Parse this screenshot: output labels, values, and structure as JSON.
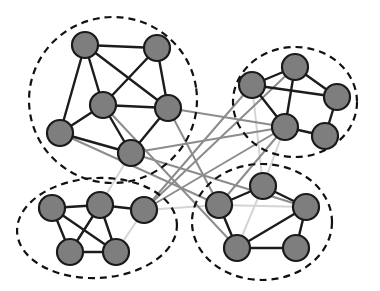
{
  "figure": {
    "width": 380,
    "height": 291,
    "background_color": "#ffffff"
  },
  "style": {
    "node_fill": "#7e7e7e",
    "node_stroke": "#1a1a1a",
    "node_radius": 13,
    "node_stroke_width": 2.2,
    "intra_edge_color": "#1c1c1c",
    "intra_edge_width": 2.4,
    "inter_edge_color": "#8c8c8c",
    "inter_edge_width": 2.0,
    "faint_edge_color": "#d5d5d5",
    "faint_edge_width": 2.0,
    "community_outline_color": "#111111",
    "community_outline_width": 2.2,
    "community_dash": "7,5"
  },
  "chart_data": {
    "type": "diagram",
    "xlabel": "",
    "ylabel": "",
    "xlim": [
      0,
      380
    ],
    "ylim": [
      0,
      291
    ],
    "grid": false,
    "legend_position": "none",
    "communities": [
      {
        "id": "c1",
        "label": "top-left-community",
        "node_count": 6,
        "cx": 113,
        "cy": 100,
        "rx": 84,
        "ry": 83,
        "rotation": -8
      },
      {
        "id": "c2",
        "label": "top-right-community",
        "node_count": 5,
        "cx": 295,
        "cy": 102,
        "rx": 62,
        "ry": 55,
        "rotation": 0
      },
      {
        "id": "c3",
        "label": "bottom-left-community",
        "node_count": 5,
        "cx": 97,
        "cy": 228,
        "rx": 80,
        "ry": 50,
        "rotation": -3
      },
      {
        "id": "c4",
        "label": "bottom-right-community",
        "node_count": 5,
        "cx": 262,
        "cy": 222,
        "rx": 70,
        "ry": 58,
        "rotation": 0
      }
    ],
    "nodes": [
      {
        "id": "n1",
        "community": "c1",
        "x": 85,
        "y": 45
      },
      {
        "id": "n2",
        "community": "c1",
        "x": 157,
        "y": 48
      },
      {
        "id": "n3",
        "community": "c1",
        "x": 103,
        "y": 105
      },
      {
        "id": "n4",
        "community": "c1",
        "x": 168,
        "y": 108
      },
      {
        "id": "n5",
        "community": "c1",
        "x": 60,
        "y": 133
      },
      {
        "id": "n6",
        "community": "c1",
        "x": 131,
        "y": 153
      },
      {
        "id": "n7",
        "community": "c2",
        "x": 295,
        "y": 67
      },
      {
        "id": "n8",
        "community": "c2",
        "x": 252,
        "y": 85
      },
      {
        "id": "n9",
        "community": "c2",
        "x": 337,
        "y": 97
      },
      {
        "id": "n10",
        "community": "c2",
        "x": 285,
        "y": 127
      },
      {
        "id": "n11",
        "community": "c2",
        "x": 325,
        "y": 136
      },
      {
        "id": "n12",
        "community": "c3",
        "x": 52,
        "y": 208
      },
      {
        "id": "n13",
        "community": "c3",
        "x": 100,
        "y": 205
      },
      {
        "id": "n14",
        "community": "c3",
        "x": 144,
        "y": 210
      },
      {
        "id": "n15",
        "community": "c3",
        "x": 70,
        "y": 252
      },
      {
        "id": "n16",
        "community": "c3",
        "x": 116,
        "y": 252
      },
      {
        "id": "n17",
        "community": "c4",
        "x": 219,
        "y": 205
      },
      {
        "id": "n18",
        "community": "c4",
        "x": 263,
        "y": 186
      },
      {
        "id": "n19",
        "community": "c4",
        "x": 306,
        "y": 207
      },
      {
        "id": "n20",
        "community": "c4",
        "x": 237,
        "y": 248
      },
      {
        "id": "n21",
        "community": "c4",
        "x": 296,
        "y": 248
      }
    ],
    "edges_intra": [
      [
        "n1",
        "n2"
      ],
      [
        "n1",
        "n3"
      ],
      [
        "n1",
        "n5"
      ],
      [
        "n1",
        "n4"
      ],
      [
        "n2",
        "n3"
      ],
      [
        "n2",
        "n4"
      ],
      [
        "n3",
        "n5"
      ],
      [
        "n3",
        "n6"
      ],
      [
        "n3",
        "n4"
      ],
      [
        "n4",
        "n6"
      ],
      [
        "n5",
        "n6"
      ],
      [
        "n7",
        "n8"
      ],
      [
        "n7",
        "n9"
      ],
      [
        "n7",
        "n10"
      ],
      [
        "n8",
        "n9"
      ],
      [
        "n8",
        "n10"
      ],
      [
        "n9",
        "n11"
      ],
      [
        "n10",
        "n11"
      ],
      [
        "n12",
        "n13"
      ],
      [
        "n12",
        "n15"
      ],
      [
        "n12",
        "n16"
      ],
      [
        "n13",
        "n14"
      ],
      [
        "n13",
        "n15"
      ],
      [
        "n13",
        "n16"
      ],
      [
        "n15",
        "n16"
      ],
      [
        "n17",
        "n18"
      ],
      [
        "n17",
        "n20"
      ],
      [
        "n18",
        "n19"
      ],
      [
        "n19",
        "n20"
      ],
      [
        "n19",
        "n21"
      ],
      [
        "n20",
        "n21"
      ]
    ],
    "edges_inter": [
      [
        "n4",
        "n10"
      ],
      [
        "n4",
        "n17"
      ],
      [
        "n6",
        "n10"
      ],
      [
        "n8",
        "n14"
      ],
      [
        "n10",
        "n17"
      ],
      [
        "n10",
        "n14"
      ],
      [
        "n14",
        "n7"
      ],
      [
        "n6",
        "n19"
      ],
      [
        "n5",
        "n17"
      ],
      [
        "n3",
        "n20"
      ]
    ],
    "edges_faint": [
      [
        "n14",
        "n17"
      ],
      [
        "n16",
        "n14"
      ],
      [
        "n13",
        "n6"
      ],
      [
        "n18",
        "n8"
      ],
      [
        "n17",
        "n19"
      ],
      [
        "n18",
        "n20"
      ],
      [
        "n10",
        "n18"
      ],
      [
        "n21",
        "n19"
      ]
    ]
  }
}
